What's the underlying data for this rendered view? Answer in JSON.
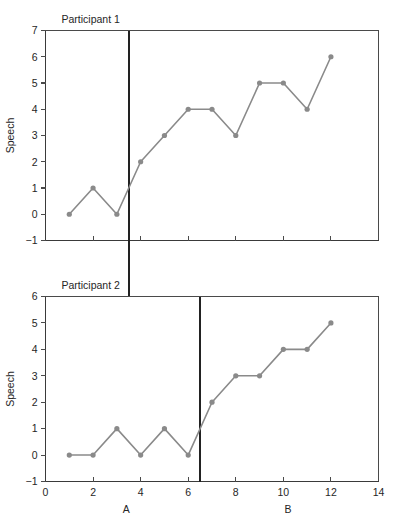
{
  "figure": {
    "title": "",
    "panels": [
      {
        "name": "Participant 1",
        "ylabel": "Speech",
        "yticks": [
          -1,
          0,
          1,
          2,
          3,
          4,
          5,
          6,
          7
        ],
        "ytick_labels": [
          "−1",
          "0",
          "1",
          "2",
          "3",
          "4",
          "5",
          "6",
          "7"
        ],
        "ylim": [
          -1,
          7
        ],
        "xlim": [
          0,
          14
        ],
        "xticks": [
          0,
          2,
          4,
          6,
          8,
          10,
          12,
          14
        ],
        "xtick_labels": [
          "",
          "",
          "",
          "",
          "",
          "",
          "",
          ""
        ],
        "phase_change_x": 3.5
      },
      {
        "name": "Participant 2",
        "ylabel": "Speech",
        "yticks": [
          -1,
          0,
          1,
          2,
          3,
          4,
          5,
          6
        ],
        "ytick_labels": [
          "−1",
          "0",
          "1",
          "2",
          "3",
          "4",
          "5",
          "6"
        ],
        "ylim": [
          -1,
          6
        ],
        "xlim": [
          0,
          14
        ],
        "xticks": [
          0,
          2,
          4,
          6,
          8,
          10,
          12,
          14
        ],
        "xtick_labels": [
          "0",
          "2",
          "4",
          "6",
          "8",
          "10",
          "12",
          "14"
        ],
        "phase_change_x": 6.5
      }
    ],
    "phase_labels": [
      {
        "text": "A",
        "x": 3.4
      },
      {
        "text": "B",
        "x": 10.2
      }
    ],
    "colors": {
      "line": "#8a8a8a",
      "marker": "#8a8a8a",
      "axis": "#3a3a3a",
      "phase_line": "#222222",
      "background": "#ffffff"
    }
  },
  "chart_data": {
    "type": "line",
    "xlabel": "",
    "ylabel": "Speech",
    "x_axis_labels_shown_on": "bottom panel only",
    "phase_labels": [
      "A",
      "B"
    ],
    "panels": [
      {
        "title": "Participant 1",
        "ylabel": "Speech",
        "ylim": [
          -1,
          7
        ],
        "yticks": [
          -1,
          0,
          1,
          2,
          3,
          4,
          5,
          6,
          7
        ],
        "xlim": [
          0,
          14
        ],
        "xticks": [
          0,
          2,
          4,
          6,
          8,
          10,
          12,
          14
        ],
        "phase_change_between_sessions": [
          3,
          4
        ],
        "phase_line_x": 3.5,
        "grid": false,
        "series": [
          {
            "name": "Participant 1 speech",
            "x": [
              1,
              2,
              3,
              4,
              5,
              6,
              7,
              8,
              9,
              10,
              11,
              12
            ],
            "values": [
              0,
              1,
              0,
              2,
              3,
              4,
              4,
              3,
              5,
              5,
              4,
              6
            ],
            "phase": [
              "A",
              "A",
              "A",
              "B",
              "B",
              "B",
              "B",
              "B",
              "B",
              "B",
              "B",
              "B"
            ]
          }
        ]
      },
      {
        "title": "Participant 2",
        "ylabel": "Speech",
        "ylim": [
          -1,
          6
        ],
        "yticks": [
          -1,
          0,
          1,
          2,
          3,
          4,
          5,
          6
        ],
        "xlim": [
          0,
          14
        ],
        "xticks": [
          0,
          2,
          4,
          6,
          8,
          10,
          12,
          14
        ],
        "phase_change_between_sessions": [
          6,
          7
        ],
        "phase_line_x": 6.5,
        "grid": false,
        "series": [
          {
            "name": "Participant 2 speech",
            "x": [
              1,
              2,
              3,
              4,
              5,
              6,
              7,
              8,
              9,
              10,
              11,
              12
            ],
            "values": [
              0,
              0,
              1,
              0,
              1,
              0,
              2,
              3,
              3,
              4,
              4,
              5
            ],
            "phase": [
              "A",
              "A",
              "A",
              "A",
              "A",
              "A",
              "B",
              "B",
              "B",
              "B",
              "B",
              "B"
            ]
          }
        ]
      }
    ],
    "legend": null,
    "legend_position": "none"
  }
}
